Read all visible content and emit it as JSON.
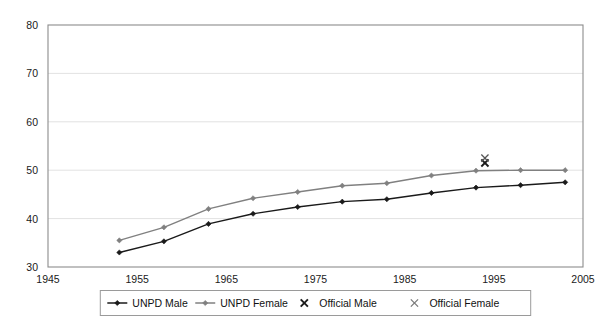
{
  "chart_data": {
    "type": "line",
    "title": "",
    "xlabel": "",
    "ylabel": "",
    "xlim": [
      1945,
      2005
    ],
    "ylim": [
      30,
      80
    ],
    "xticks": [
      1945,
      1955,
      1965,
      1975,
      1985,
      1995,
      2005
    ],
    "xtick_labels": [
      "1945",
      "1955",
      "1965",
      "1975",
      "1985",
      "1995",
      "2005"
    ],
    "yticks": [
      30,
      40,
      50,
      60,
      70,
      80
    ],
    "ytick_labels": [
      "30",
      "40",
      "50",
      "60",
      "70",
      "80"
    ],
    "grid": "horizontal",
    "legend_position": "bottom-center",
    "x": [
      1953,
      1958,
      1963,
      1968,
      1973,
      1978,
      1983,
      1988,
      1993,
      1998,
      2003
    ],
    "series": [
      {
        "name": "UNPD Male",
        "marker": "diamond",
        "color": "#1a1a1a",
        "values": [
          33.0,
          35.3,
          38.9,
          41.0,
          42.4,
          43.5,
          44.0,
          45.3,
          46.4,
          46.9,
          47.5
        ]
      },
      {
        "name": "UNPD Female",
        "marker": "diamond",
        "color": "#808080",
        "values": [
          35.5,
          38.2,
          42.0,
          44.2,
          45.5,
          46.8,
          47.3,
          48.9,
          49.9,
          50.0,
          50.0
        ]
      },
      {
        "name": "Official Male",
        "marker": "x",
        "color": "#1a1a1a",
        "points": [
          {
            "x": 1994,
            "y": 51.5
          }
        ]
      },
      {
        "name": "Official Female",
        "marker": "x",
        "color": "#555555",
        "points": [
          {
            "x": 1994,
            "y": 52.5
          }
        ]
      }
    ],
    "legend": [
      {
        "label": "UNPD Male",
        "marker": "line-diamond",
        "color": "#1a1a1a"
      },
      {
        "label": "UNPD Female",
        "marker": "line-diamond",
        "color": "#808080"
      },
      {
        "label": "Official Male",
        "marker": "x",
        "color": "#1a1a1a"
      },
      {
        "label": "Official Female",
        "marker": "x",
        "color": "#777777"
      }
    ]
  },
  "colors": {
    "plot_border": "#8c8c8c",
    "gridline": "#e2e2e2",
    "legend_border": "#9a9a9a",
    "background": "#ffffff",
    "male": "#1a1a1a",
    "female": "#808080"
  }
}
